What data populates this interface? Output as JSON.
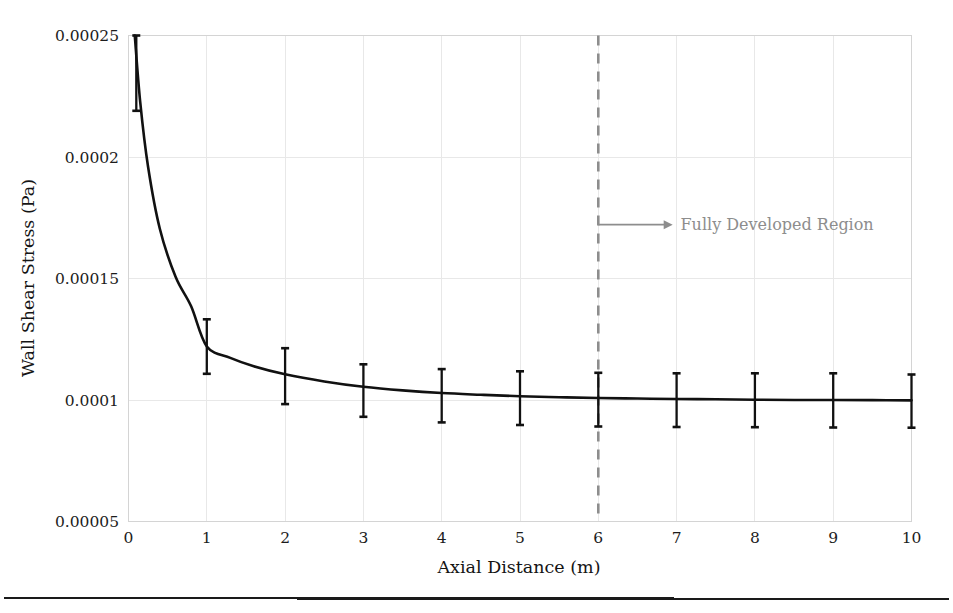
{
  "chart_data": {
    "type": "line",
    "title": "",
    "xlabel": "Axial Distance (m)",
    "ylabel": "Wall Shear Stress (Pa)",
    "xlim": [
      0,
      10
    ],
    "ylim": [
      5e-05,
      0.00025
    ],
    "grid": true,
    "legend_position": "none",
    "xticks": [
      0,
      1,
      2,
      3,
      4,
      5,
      6,
      7,
      8,
      9,
      10
    ],
    "xtick_labels": [
      "0",
      "1",
      "2",
      "3",
      "4",
      "5",
      "6",
      "7",
      "8",
      "9",
      "10"
    ],
    "yticks": [
      5e-05,
      0.0001,
      0.00015,
      0.0002,
      0.00025
    ],
    "ytick_labels": [
      "0.00005",
      "0.0001",
      "0.00015",
      "0.0002",
      "0.00025"
    ],
    "series": [
      {
        "name": "Wall Shear Stress",
        "color": "#111111",
        "x": [
          0.08,
          0.15,
          0.25,
          0.4,
          0.6,
          0.8,
          1.0,
          1.3,
          1.6,
          2.0,
          2.5,
          3.0,
          3.5,
          4.0,
          4.5,
          5.0,
          5.5,
          6.0,
          6.5,
          7.0,
          7.5,
          8.0,
          8.5,
          9.0,
          9.5,
          10.0
        ],
        "y": [
          0.00025,
          0.0002225,
          0.000196,
          0.0001705,
          0.0001508,
          0.00013855,
          0.00012205,
          0.00011735,
          0.0001139,
          0.0001106,
          0.00010765,
          0.00010545,
          0.00010395,
          0.00010285,
          0.00010215,
          0.00010155,
          0.00010115,
          0.0001008,
          0.0001006,
          0.0001004,
          0.0001003,
          0.0001001,
          0.0001,
          0.0001,
          9.995e-05,
          9.985e-05
        ]
      }
    ],
    "errorbars": {
      "x": [
        0.1,
        1,
        2,
        3,
        4,
        5,
        6,
        7,
        8,
        9,
        10
      ],
      "y": [
        0.000237,
        0.000122,
        0.00011,
        0.0001035,
        0.0001015,
        0.0001008,
        0.0001002,
        0.0001,
        0.0001,
        0.0001,
        9.99e-05
      ],
      "upper": [
        0.00025,
        0.0001332,
        0.0001213,
        0.0001147,
        0.0001127,
        0.0001118,
        0.0001112,
        0.000111,
        0.000111,
        0.000111,
        0.0001105
      ],
      "lower": [
        0.000219,
        0.0001108,
        9.83e-05,
        9.31e-05,
        9.08e-05,
        8.97e-05,
        8.91e-05,
        8.89e-05,
        8.88e-05,
        8.87e-05,
        8.86e-05
      ]
    },
    "annotations": [
      {
        "name": "fully-developed-region",
        "text": "Fully Developed Region",
        "color": "#8d8d8d",
        "arrow_from_x": 6.0,
        "arrow_to_x": 6.95,
        "arrow_y": 0.00017215,
        "text_x": 7.05
      }
    ],
    "reference_lines": [
      {
        "name": "fully-developed-start",
        "orientation": "vertical",
        "x": 6.0,
        "style": "dashed",
        "color": "#8d8d8d"
      }
    ]
  },
  "figure": {
    "bottom_rule_present": true
  }
}
